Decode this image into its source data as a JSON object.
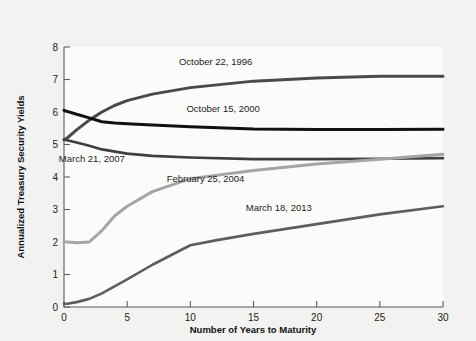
{
  "chart_data": {
    "type": "line",
    "title": "",
    "xlabel": "Number of Years to Maturity",
    "ylabel": "Annualized Treasury Security Yields",
    "xlim": [
      0,
      30
    ],
    "ylim": [
      0,
      8
    ],
    "xticks": [
      0,
      5,
      10,
      15,
      20,
      25,
      30
    ],
    "yticks": [
      0,
      1,
      2,
      3,
      4,
      5,
      6,
      7,
      8
    ],
    "xtick_labels": [
      "0",
      "5",
      "10",
      "15",
      "20",
      "25",
      "30"
    ],
    "ytick_labels": [
      "0",
      "1",
      "2",
      "3",
      "4",
      "5",
      "6",
      "7",
      "8"
    ],
    "grid": false,
    "legend": "inline-labels",
    "series": [
      {
        "name": "October 22, 1996",
        "color": "#4a4a4a",
        "width": 3.0,
        "label_x": 12.0,
        "label_y": 7.45,
        "x": [
          0,
          0.25,
          1,
          2,
          3,
          4,
          5,
          7,
          10,
          15,
          20,
          25,
          30
        ],
        "y": [
          5.15,
          5.2,
          5.45,
          5.75,
          6.0,
          6.2,
          6.35,
          6.55,
          6.75,
          6.95,
          7.05,
          7.1,
          7.1
        ]
      },
      {
        "name": "October 15, 2000",
        "color": "#111111",
        "width": 3.0,
        "label_x": 12.6,
        "label_y": 6.0,
        "x": [
          0,
          0.25,
          1,
          2,
          3,
          4,
          5,
          7,
          10,
          15,
          20,
          25,
          30
        ],
        "y": [
          6.05,
          6.02,
          5.93,
          5.82,
          5.7,
          5.66,
          5.64,
          5.6,
          5.55,
          5.48,
          5.46,
          5.46,
          5.47
        ]
      },
      {
        "name": "March 21, 2007",
        "color": "#3f3f3f",
        "width": 2.6,
        "label_x": 2.2,
        "label_y": 4.45,
        "x": [
          0,
          0.25,
          1,
          2,
          3,
          5,
          7,
          10,
          15,
          20,
          25,
          30
        ],
        "y": [
          5.15,
          5.13,
          5.06,
          4.96,
          4.85,
          4.72,
          4.65,
          4.6,
          4.55,
          4.55,
          4.56,
          4.58
        ]
      },
      {
        "name": "February 25, 2004",
        "color": "#a5a5a5",
        "width": 3.0,
        "label_x": 11.2,
        "label_y": 3.85,
        "x": [
          0,
          0.25,
          1,
          2,
          3,
          4,
          5,
          7,
          10,
          15,
          20,
          25,
          30
        ],
        "y": [
          2.0,
          2.0,
          1.98,
          2.0,
          2.35,
          2.8,
          3.1,
          3.55,
          3.95,
          4.2,
          4.4,
          4.55,
          4.7
        ]
      },
      {
        "name": "March 18, 2013",
        "color": "#5e5e5e",
        "width": 2.6,
        "label_x": 17.0,
        "label_y": 2.95,
        "x": [
          0,
          0.25,
          1,
          2,
          3,
          5,
          7,
          10,
          12,
          15,
          20,
          25,
          30
        ],
        "y": [
          0.1,
          0.1,
          0.15,
          0.25,
          0.42,
          0.85,
          1.3,
          1.9,
          2.05,
          2.25,
          2.55,
          2.85,
          3.1
        ]
      }
    ]
  },
  "figure": {
    "background_color": "#f2f2f0",
    "plot_background_color": "#fbfbfa",
    "axis_color": "#5d5d5d"
  }
}
